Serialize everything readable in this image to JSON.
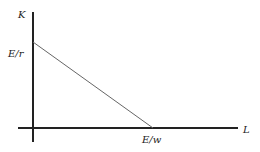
{
  "diagram": {
    "y_axis_label": "K",
    "x_axis_label": "L",
    "y_intercept_label": "E/r",
    "x_intercept_label": "E/w",
    "colors": {
      "axis": "#222222",
      "line": "#555555",
      "text": "#222222"
    }
  }
}
